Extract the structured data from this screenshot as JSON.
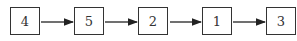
{
  "diagram": {
    "type": "linked-list",
    "nodes": [
      {
        "label": "4"
      },
      {
        "label": "5"
      },
      {
        "label": "2"
      },
      {
        "label": "1"
      },
      {
        "label": "3"
      }
    ],
    "edges": [
      [
        "4",
        "5"
      ],
      [
        "5",
        "2"
      ],
      [
        "2",
        "1"
      ],
      [
        "1",
        "3"
      ]
    ]
  }
}
